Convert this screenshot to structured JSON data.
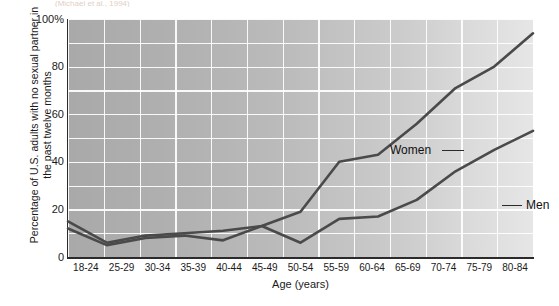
{
  "top_caption": "(Michael et al., 1994)",
  "chart_data": {
    "type": "line",
    "title": "",
    "xlabel": "Age (years)",
    "ylabel": "Percentage of U.S. adults with no sexual partner in the past twelve months",
    "categories": [
      "18-24",
      "25-29",
      "30-34",
      "35-39",
      "40-44",
      "45-49",
      "50-54",
      "55-59",
      "60-64",
      "65-69",
      "70-74",
      "75-79",
      "80-84"
    ],
    "xlim": [
      0,
      12
    ],
    "ylim": [
      0,
      100
    ],
    "yticks": [
      "0",
      "20",
      "40",
      "60",
      "80",
      "100%"
    ],
    "ytick_values": [
      0,
      20,
      40,
      60,
      80,
      100
    ],
    "grid": true,
    "grid_step": 10,
    "legend_position": "inline-annotation",
    "series": [
      {
        "name": "Women",
        "color": "#4a4a4a",
        "values": [
          15,
          6,
          9,
          10,
          11,
          13,
          19,
          40,
          43,
          56,
          71,
          80,
          94
        ]
      },
      {
        "name": "Men",
        "color": "#4a4a4a",
        "values": [
          12,
          5,
          8,
          9,
          7,
          13,
          6,
          16,
          17,
          24,
          36,
          45,
          53
        ]
      }
    ],
    "annotations": [
      {
        "text": "Women",
        "anchor_category": "55-59"
      },
      {
        "text": "Men",
        "anchor_category": "70-74"
      }
    ]
  }
}
